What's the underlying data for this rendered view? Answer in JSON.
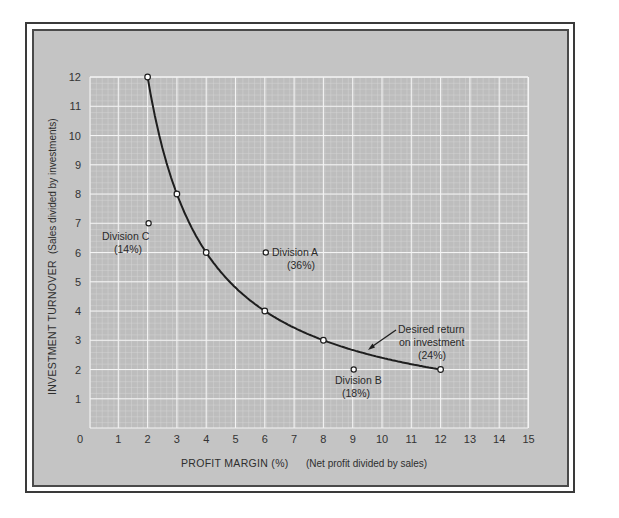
{
  "chart_data": {
    "type": "line",
    "title": "",
    "xlabel": "PROFIT MARGIN  (%)",
    "xlabel_note": "(Net profit divided by sales)",
    "ylabel": "INVESTMENT TURNOVER",
    "ylabel_note": "(Sales divided by investments)",
    "xlim": [
      0,
      15
    ],
    "ylim": [
      0,
      12
    ],
    "x_ticks": [
      "0",
      "1",
      "2",
      "3",
      "4",
      "5",
      "6",
      "7",
      "8",
      "9",
      "10",
      "11",
      "12",
      "13",
      "14",
      "15"
    ],
    "y_ticks": [
      "1",
      "2",
      "3",
      "4",
      "5",
      "6",
      "7",
      "8",
      "9",
      "10",
      "11",
      "12"
    ],
    "grid": true,
    "series": [
      {
        "name": "Desired return on investment (24%)",
        "type": "line",
        "x": [
          2,
          3,
          4,
          6,
          8,
          12
        ],
        "y": [
          12,
          8,
          6,
          4,
          3,
          2
        ]
      },
      {
        "name": "Divisions",
        "type": "scatter",
        "points": [
          {
            "label": "Division A",
            "rate": "(36%)",
            "x": 6,
            "y": 6
          },
          {
            "label": "Division B",
            "rate": "(18%)",
            "x": 9,
            "y": 2
          },
          {
            "label": "Division C",
            "rate": "(14%)",
            "x": 2,
            "y": 7
          }
        ]
      }
    ],
    "annotations": [
      {
        "text_lines": [
          "Desired return",
          "on investment",
          "(24%)"
        ],
        "arrow_to": {
          "x": 9.5,
          "y": 2.7
        }
      }
    ]
  },
  "labels": {
    "division_a": "Division A",
    "division_a_rate": "(36%)",
    "division_b": "Division B",
    "division_b_rate": "(18%)",
    "division_c": "Division C",
    "division_c_rate": "(14%)",
    "curve_line1": "Desired return",
    "curve_line2": "on investment",
    "curve_line3": "(24%)",
    "xlabel": "PROFIT MARGIN  (%)",
    "xlabel_note": "(Net profit divided by sales)",
    "ylabel": "INVESTMENT TURNOVER",
    "ylabel_note": "(Sales divided by investments)"
  },
  "colors": {
    "panel": "#c4c4c4",
    "plot_bg": "#bdbdbd",
    "grid_major": "#f2f2f2",
    "grid_minor": "#dcdcdc",
    "curve": "#1e1e1e"
  }
}
